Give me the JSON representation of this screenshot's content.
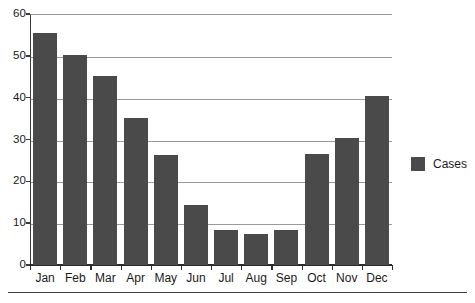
{
  "chart_data": {
    "type": "bar",
    "title": "",
    "subtitle": "",
    "xlabel": "",
    "ylabel": "",
    "categories": [
      "Jan",
      "Feb",
      "Mar",
      "Apr",
      "May",
      "Jun",
      "Jul",
      "Aug",
      "Sep",
      "Oct",
      "Nov",
      "Dec"
    ],
    "series": [
      {
        "name": "Cases",
        "color": "#4a4a4a",
        "values": [
          55.5,
          50.3,
          45.2,
          35.2,
          26.2,
          14.3,
          8.4,
          7.4,
          8.4,
          26.5,
          30.4,
          40.4
        ]
      }
    ],
    "ylim": [
      0,
      60
    ],
    "ytick_values": [
      0,
      10,
      20,
      30,
      40,
      50,
      60
    ],
    "ytick_labels": [
      "0",
      "10",
      "20",
      "30",
      "40",
      "50",
      "60"
    ],
    "grid": "horizontal",
    "legend": {
      "position": "right",
      "entries": [
        {
          "label": "Cases",
          "color": "#4a4a4a"
        }
      ]
    },
    "bar_color": "#4a4a4a",
    "gridline_color": "#9b9b9b",
    "axis_color": "#2b2b2b",
    "background": "#ffffff"
  }
}
